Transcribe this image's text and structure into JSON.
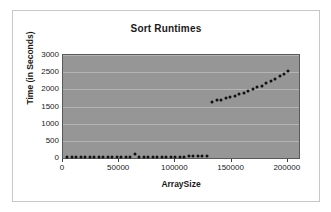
{
  "chart_data": {
    "type": "scatter",
    "title": "Sort Runtimes",
    "xlabel": "ArraySize",
    "ylabel": "Time (in Seconds)",
    "xlim": [
      0,
      210000
    ],
    "ylim": [
      0,
      3000
    ],
    "xticks": [
      0,
      50000,
      100000,
      150000,
      200000
    ],
    "xtick_labels": [
      "0",
      "50000",
      "100000",
      "150000",
      "200000"
    ],
    "yticks": [
      0,
      500,
      1000,
      1500,
      2000,
      2500,
      3000
    ],
    "ytick_labels": [
      "0",
      "500",
      "1000",
      "1500",
      "2000",
      "2500",
      "3000"
    ],
    "grid": true,
    "grid_axis": "y",
    "legend": false,
    "plot_background": "#969696",
    "marker_color": "#111111",
    "series": [
      {
        "name": "Sort Runtimes",
        "points": [
          [
            4000,
            20
          ],
          [
            8000,
            20
          ],
          [
            12000,
            20
          ],
          [
            16000,
            20
          ],
          [
            20000,
            20
          ],
          [
            24000,
            20
          ],
          [
            28000,
            20
          ],
          [
            32000,
            20
          ],
          [
            36000,
            20
          ],
          [
            40000,
            20
          ],
          [
            44000,
            20
          ],
          [
            48000,
            20
          ],
          [
            52000,
            20
          ],
          [
            56000,
            20
          ],
          [
            60000,
            20
          ],
          [
            64000,
            130
          ],
          [
            68000,
            25
          ],
          [
            72000,
            25
          ],
          [
            76000,
            25
          ],
          [
            80000,
            30
          ],
          [
            84000,
            30
          ],
          [
            88000,
            30
          ],
          [
            92000,
            35
          ],
          [
            96000,
            35
          ],
          [
            100000,
            35
          ],
          [
            104000,
            40
          ],
          [
            108000,
            40
          ],
          [
            112000,
            45
          ],
          [
            116000,
            45
          ],
          [
            120000,
            50
          ],
          [
            124000,
            50
          ],
          [
            128000,
            55
          ],
          [
            133000,
            1620
          ],
          [
            137000,
            1680
          ],
          [
            141000,
            1700
          ],
          [
            145000,
            1740
          ],
          [
            149000,
            1780
          ],
          [
            153000,
            1810
          ],
          [
            157000,
            1860
          ],
          [
            161000,
            1900
          ],
          [
            165000,
            1950
          ],
          [
            169000,
            2000
          ],
          [
            173000,
            2060
          ],
          [
            177000,
            2110
          ],
          [
            181000,
            2170
          ],
          [
            185000,
            2240
          ],
          [
            189000,
            2310
          ],
          [
            193000,
            2390
          ],
          [
            197000,
            2450
          ],
          [
            200000,
            2520
          ]
        ]
      }
    ]
  }
}
